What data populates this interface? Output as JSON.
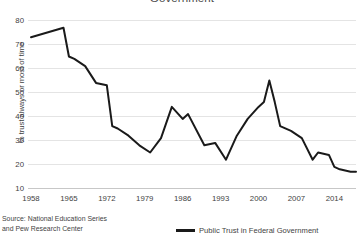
{
  "chart_data": {
    "type": "line",
    "title": "Government",
    "xlabel": "",
    "ylabel": "% trust always or most of time",
    "xlim": [
      1958,
      2018
    ],
    "ylim": [
      10,
      80
    ],
    "grid": true,
    "legend_position": "bottom-right",
    "xticks": [
      "1958",
      "1965",
      "1972",
      "1979",
      "1986",
      "1993",
      "2000",
      "2007",
      "2014"
    ],
    "yticks": [
      "10",
      "20",
      "30",
      "40",
      "50",
      "60",
      "70",
      "80"
    ],
    "series": [
      {
        "name": "Public Trust in Federal Government",
        "color": "#1a1a1a",
        "x": [
          1958,
          1964,
          1965,
          1966,
          1968,
          1970,
          1972,
          1973,
          1974,
          1976,
          1978,
          1980,
          1982,
          1984,
          1986,
          1987,
          1990,
          1992,
          1994,
          1996,
          1998,
          2000,
          2001,
          2002,
          2003,
          2004,
          2006,
          2008,
          2010,
          2011,
          2013,
          2014,
          2015,
          2017,
          2018
        ],
        "values": [
          73,
          77,
          65,
          64,
          61,
          54,
          53,
          36,
          35,
          32,
          28,
          25,
          31,
          44,
          39,
          41,
          28,
          29,
          22,
          32,
          39,
          44,
          46,
          55,
          46,
          36,
          34,
          31,
          22,
          25,
          24,
          19,
          18,
          17,
          17
        ]
      }
    ],
    "source_note": "Source: National Education Series and Pew Research Center"
  },
  "source": {
    "line1": "Source: National Education Series",
    "line2": "and Pew Research Center"
  },
  "legend": {
    "label": "Public Trust in Federal Government"
  }
}
